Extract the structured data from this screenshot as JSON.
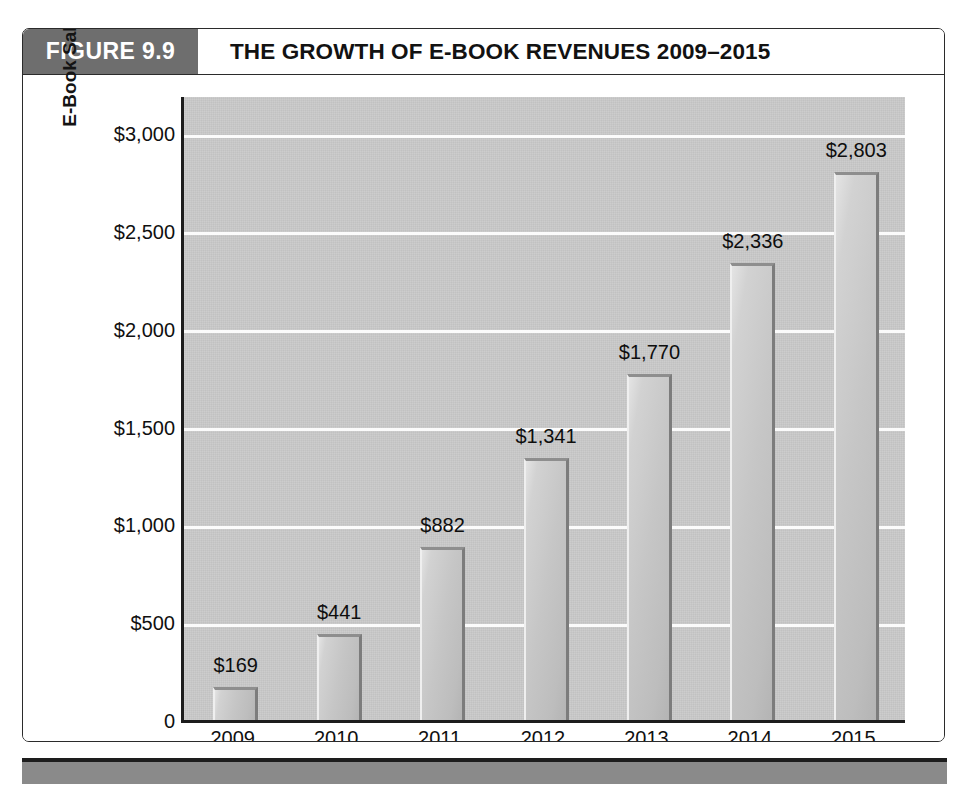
{
  "figure": {
    "tag": "FIGURE 9.9",
    "title": "THE GROWTH OF E-BOOK REVENUES 2009–2015"
  },
  "colors": {
    "tag_background": "#6e6e6e",
    "plot_background": "#c9c9c9",
    "gridline": "#fbfbfb",
    "bar_fill": "#c6c6c6",
    "bar_edge_dark": "#7c7c7c",
    "axis_line": "#1c1c1c",
    "footer_band": "#8a8a8a",
    "text": "#101010"
  },
  "chart_data": {
    "type": "bar",
    "title": "THE GROWTH OF E-BOOK REVENUES 2009–2015",
    "xlabel": "Year",
    "ylabel": "E-Book Sales (in millions)",
    "categories": [
      "2009",
      "2010",
      "2011",
      "2012",
      "2013",
      "2014",
      "2015"
    ],
    "values": [
      169,
      441,
      882,
      1341,
      1770,
      2336,
      2803
    ],
    "value_labels": [
      "$169",
      "$441",
      "$882",
      "$1,341",
      "$1,770",
      "$2,336",
      "$2,803"
    ],
    "ylim": [
      0,
      3200
    ],
    "yticks": [
      0,
      500,
      1000,
      1500,
      2000,
      2500,
      3000
    ],
    "ytick_labels": [
      "0",
      "$500",
      "$1,000",
      "$1,500",
      "$2,000",
      "$2,500",
      "$3,000"
    ],
    "grid": true,
    "grid_axis": "y",
    "legend": false,
    "legend_position": "none",
    "series": [
      {
        "name": "E-Book Sales (in millions)",
        "values": [
          169,
          441,
          882,
          1341,
          1770,
          2336,
          2803
        ]
      }
    ],
    "points": [
      {
        "x": "2009",
        "y": 169,
        "label": "$169"
      },
      {
        "x": "2010",
        "y": 441,
        "label": "$441"
      },
      {
        "x": "2011",
        "y": 882,
        "label": "$882"
      },
      {
        "x": "2012",
        "y": 1341,
        "label": "$1,341"
      },
      {
        "x": "2013",
        "y": 1770,
        "label": "$1,770"
      },
      {
        "x": "2014",
        "y": 2336,
        "label": "$2,336"
      },
      {
        "x": "2015",
        "y": 2803,
        "label": "$2,803"
      }
    ]
  }
}
